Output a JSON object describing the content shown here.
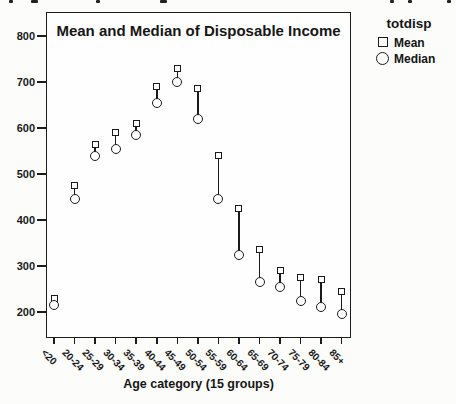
{
  "decor": {
    "top_cropped_fragment_x": [
      9,
      31,
      96,
      160,
      390,
      408,
      447
    ]
  },
  "figure": {
    "x_axis_title": "Age category (15 groups)",
    "legend": {
      "title": "totdisp",
      "items": [
        {
          "marker": "square",
          "label": "Mean"
        },
        {
          "marker": "circle",
          "label": "Median"
        }
      ]
    }
  },
  "chart_data": {
    "type": "scatter",
    "title": "Mean and Median of Disposable Income",
    "xlabel": "Age category (15 groups)",
    "ylabel": "",
    "ylim": [
      145,
      850
    ],
    "y_ticks": [
      800,
      700,
      600,
      500,
      400,
      300,
      200
    ],
    "grid": false,
    "legend_title": "totdisp",
    "legend_position": "top-right-outside",
    "drop_lines_between_series": true,
    "marker_style": "open",
    "categories": [
      "<20",
      "20-24",
      "25-29",
      "30-34",
      "35-39",
      "40-44",
      "45-49",
      "50-54",
      "55-59",
      "60-64",
      "65-69",
      "70-74",
      "75-79",
      "80-84",
      "85+"
    ],
    "series": [
      {
        "name": "Mean",
        "marker": "square",
        "values": [
          230,
          475,
          565,
          590,
          610,
          690,
          730,
          685,
          540,
          425,
          335,
          290,
          275,
          270,
          245
        ]
      },
      {
        "name": "Median",
        "marker": "circle",
        "values": [
          215,
          445,
          540,
          555,
          585,
          655,
          700,
          620,
          445,
          325,
          265,
          255,
          225,
          210,
          195
        ]
      }
    ]
  }
}
